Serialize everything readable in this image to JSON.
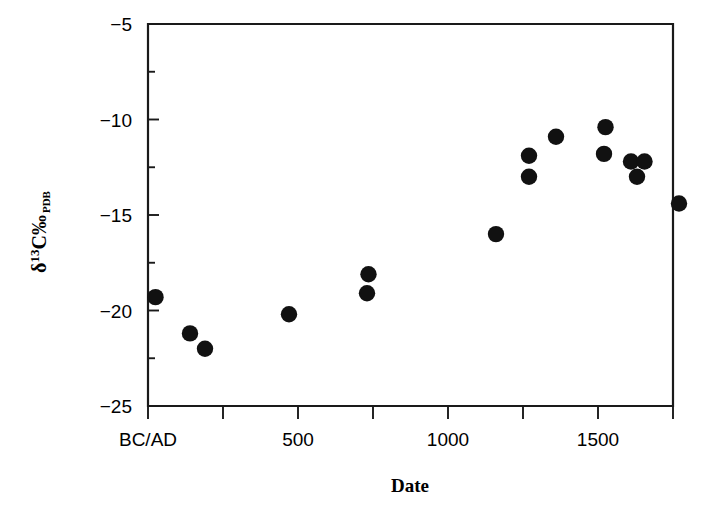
{
  "figure": {
    "title": "",
    "background_color": "#ffffff",
    "marker_color": "#111111",
    "axis_color": "#1a1a1a"
  },
  "axes": {
    "x": {
      "label": "Date",
      "tick_labels": [
        "BC/AD",
        "500",
        "1000",
        "1500"
      ],
      "tick_values": [
        0,
        500,
        1000,
        1500
      ],
      "minor_tick_values": [
        250,
        750,
        1250,
        1750
      ],
      "range": [
        0,
        1750
      ]
    },
    "y": {
      "label_parts": {
        "delta": "δ",
        "superscript": "13",
        "element": "C",
        "permil": "‰",
        "subscript": "PDB"
      },
      "label_text": "δ13C‰PDB",
      "tick_labels": [
        "−5",
        "−10",
        "−15",
        "−20",
        "−25"
      ],
      "tick_values": [
        -5,
        -10,
        -15,
        -20,
        -25
      ],
      "minor_tick_values": [
        -7.5,
        -12.5,
        -17.5,
        -22.5
      ],
      "range": [
        -25,
        -5
      ]
    }
  },
  "chart_data": {
    "type": "scatter",
    "title": "",
    "xlabel": "Date",
    "ylabel": "δ13C‰ PDB",
    "xlim": [
      0,
      1750
    ],
    "ylim": [
      -25,
      -5
    ],
    "grid": false,
    "legend": null,
    "marker": "filled-circle",
    "series": [
      {
        "name": "δ13C measurements",
        "points": [
          {
            "x": 25,
            "y": -19.3
          },
          {
            "x": 140,
            "y": -21.2
          },
          {
            "x": 190,
            "y": -22.0
          },
          {
            "x": 470,
            "y": -20.2
          },
          {
            "x": 735,
            "y": -18.1
          },
          {
            "x": 730,
            "y": -19.1
          },
          {
            "x": 1160,
            "y": -16.0
          },
          {
            "x": 1270,
            "y": -11.9
          },
          {
            "x": 1270,
            "y": -13.0
          },
          {
            "x": 1360,
            "y": -10.9
          },
          {
            "x": 1525,
            "y": -10.4
          },
          {
            "x": 1520,
            "y": -11.8
          },
          {
            "x": 1610,
            "y": -12.2
          },
          {
            "x": 1655,
            "y": -12.2
          },
          {
            "x": 1630,
            "y": -13.0
          },
          {
            "x": 1770,
            "y": -14.4
          }
        ]
      }
    ]
  }
}
